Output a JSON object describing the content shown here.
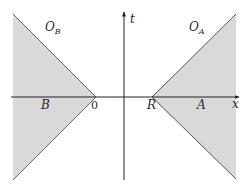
{
  "diagram": {
    "type": "spacetime-diagram",
    "axes": {
      "x_label": "x",
      "t_label": "t"
    },
    "points": {
      "origin_label": "0",
      "r_label": "R"
    },
    "regions": [
      {
        "id": "B",
        "label": "B",
        "observer_label": "O",
        "observer_sub": "B",
        "side": "left"
      },
      {
        "id": "A",
        "label": "A",
        "observer_label": "O",
        "observer_sub": "A",
        "side": "right"
      }
    ],
    "colors": {
      "region_fill": "#d9d9d9",
      "line": "#555555",
      "axis": "#222222",
      "background": "#ffffff"
    }
  }
}
